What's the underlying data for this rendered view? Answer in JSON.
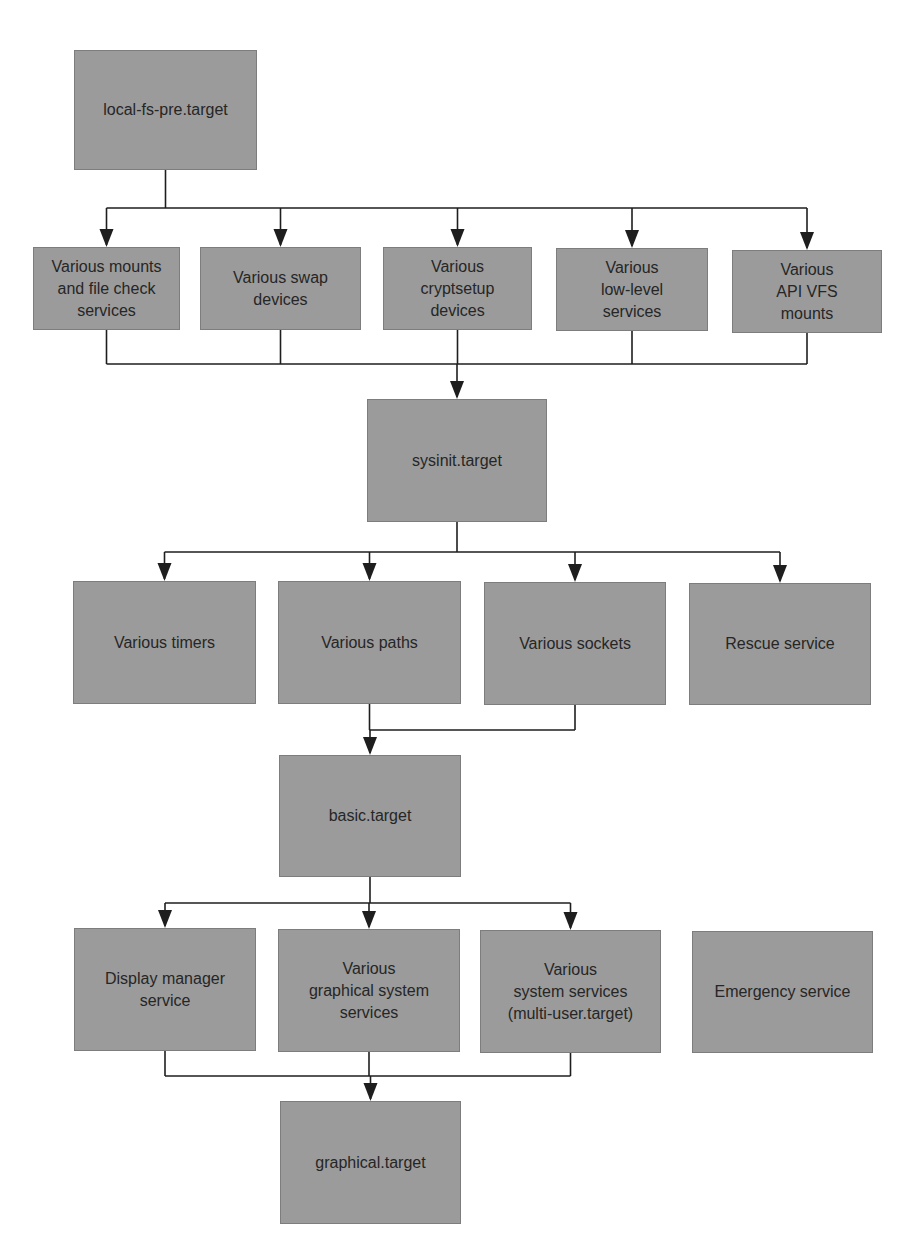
{
  "diagram": {
    "colors": {
      "box_fill": "#9b9b9b",
      "box_border": "#7d7d7d",
      "text": "#262626",
      "line": "#1e1e1e",
      "background": "#ffffff"
    },
    "nodes": [
      {
        "id": "local-fs-pre",
        "label": "local-fs-pre.target",
        "x": 74,
        "y": 50,
        "w": 183,
        "h": 120
      },
      {
        "id": "mounts",
        "label": "Various mounts\nand file check\nservices",
        "x": 33,
        "y": 247,
        "w": 147,
        "h": 83
      },
      {
        "id": "swap",
        "label": "Various swap\ndevices",
        "x": 200,
        "y": 247,
        "w": 161,
        "h": 83
      },
      {
        "id": "cryptsetup",
        "label": "Various\ncryptsetup\ndevices",
        "x": 383,
        "y": 247,
        "w": 149,
        "h": 83
      },
      {
        "id": "lowlevel",
        "label": "Various\nlow-level\nservices",
        "x": 556,
        "y": 248,
        "w": 152,
        "h": 83
      },
      {
        "id": "apivfs",
        "label": "Various\nAPI VFS\nmounts",
        "x": 732,
        "y": 250,
        "w": 150,
        "h": 83
      },
      {
        "id": "sysinit",
        "label": "sysinit.target",
        "x": 367,
        "y": 399,
        "w": 180,
        "h": 123
      },
      {
        "id": "timers",
        "label": "Various timers",
        "x": 73,
        "y": 581,
        "w": 183,
        "h": 123
      },
      {
        "id": "paths",
        "label": "Various paths",
        "x": 278,
        "y": 581,
        "w": 183,
        "h": 123
      },
      {
        "id": "sockets",
        "label": "Various sockets",
        "x": 484,
        "y": 582,
        "w": 182,
        "h": 123
      },
      {
        "id": "rescue",
        "label": "Rescue service",
        "x": 689,
        "y": 583,
        "w": 182,
        "h": 122
      },
      {
        "id": "basic",
        "label": "basic.target",
        "x": 279,
        "y": 755,
        "w": 182,
        "h": 122
      },
      {
        "id": "display",
        "label": "Display manager\nservice",
        "x": 74,
        "y": 928,
        "w": 182,
        "h": 123
      },
      {
        "id": "graphical-sys",
        "label": "Various\ngraphical system\nservices",
        "x": 278,
        "y": 929,
        "w": 182,
        "h": 123
      },
      {
        "id": "multi-user",
        "label": "Various\nsystem services\n(multi-user.target)",
        "x": 480,
        "y": 930,
        "w": 181,
        "h": 123
      },
      {
        "id": "emergency",
        "label": "Emergency service",
        "x": 692,
        "y": 931,
        "w": 181,
        "h": 122
      },
      {
        "id": "graphical",
        "label": "graphical.target",
        "x": 280,
        "y": 1101,
        "w": 181,
        "h": 123
      }
    ],
    "edges": [
      {
        "from": "local-fs-pre",
        "to": [
          "mounts",
          "swap",
          "cryptsetup",
          "lowlevel",
          "apivfs"
        ],
        "bus_y": 208
      },
      {
        "from": [
          "mounts",
          "swap",
          "cryptsetup",
          "lowlevel",
          "apivfs"
        ],
        "to": "sysinit",
        "bus_y": 364
      },
      {
        "from": "sysinit",
        "to": [
          "timers",
          "paths",
          "sockets",
          "rescue"
        ],
        "bus_y": 552
      },
      {
        "from": [
          "paths",
          "sockets"
        ],
        "to": "basic",
        "bus_y": 730
      },
      {
        "from": "basic",
        "to": [
          "display",
          "graphical-sys",
          "multi-user"
        ],
        "bus_y": 903
      },
      {
        "from": [
          "display",
          "graphical-sys",
          "multi-user"
        ],
        "to": "graphical",
        "bus_y": 1076
      }
    ]
  }
}
